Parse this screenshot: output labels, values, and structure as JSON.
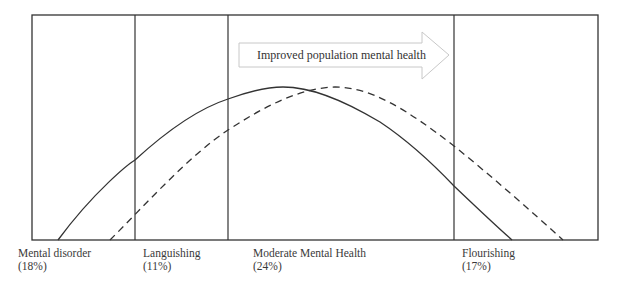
{
  "diagram": {
    "arrow": {
      "label": "Improved population mental health"
    },
    "zones": [
      {
        "name": "Mental disorder",
        "percent": "(18%)"
      },
      {
        "name": "Languishing",
        "percent": "(11%)"
      },
      {
        "name": "Moderate Mental Health",
        "percent": "(24%)"
      },
      {
        "name": "Flourishing",
        "percent": "(17%)"
      }
    ],
    "curves": [
      {
        "name": "current-distribution",
        "style": "solid"
      },
      {
        "name": "improved-distribution",
        "style": "dashed"
      }
    ],
    "colors": {
      "line": "#333333",
      "arrow_stroke": "#c8c8c8",
      "text": "#3a3a3a"
    }
  }
}
